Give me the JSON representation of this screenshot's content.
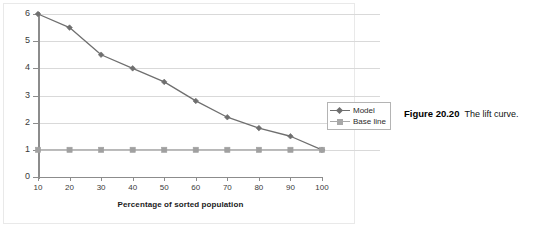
{
  "figure": {
    "caption_number": "Figure 20.20",
    "caption_text": "The lift curve."
  },
  "legend": {
    "position": "right",
    "entries": [
      {
        "label": "Model",
        "marker": "diamond-marker",
        "color": "#7d7d7d"
      },
      {
        "label": "Base line",
        "marker": "square-marker",
        "color": "#a8a8a8"
      }
    ]
  },
  "chart_data": {
    "type": "line",
    "title": "",
    "subtitle": "",
    "xlabel": "Percentage of sorted population",
    "ylabel": "",
    "x": [
      10,
      20,
      30,
      40,
      50,
      60,
      70,
      80,
      90,
      100
    ],
    "xticks": [
      "10",
      "20",
      "30",
      "40",
      "50",
      "60",
      "70",
      "80",
      "90",
      "100"
    ],
    "yticks": [
      "0",
      "1",
      "2",
      "3",
      "4",
      "5",
      "6"
    ],
    "xlim": [
      10,
      100
    ],
    "ylim": [
      0,
      6
    ],
    "grid": true,
    "grid_axis": "y",
    "legend_position": "right",
    "series": [
      {
        "name": "Model",
        "marker": "diamond",
        "color": "#6f6f6f",
        "values": [
          6.0,
          5.5,
          4.5,
          4.0,
          3.5,
          2.8,
          2.2,
          1.8,
          1.5,
          1.0
        ]
      },
      {
        "name": "Base line",
        "marker": "square",
        "color": "#a0a0a0",
        "values": [
          1.0,
          1.0,
          1.0,
          1.0,
          1.0,
          1.0,
          1.0,
          1.0,
          1.0,
          1.0
        ]
      }
    ]
  },
  "colors": {
    "model_line": "#6f6f6f",
    "baseline_line": "#a0a0a0",
    "gridline": "#d9d9d9",
    "axis": "#8c8c8c",
    "text": "#2b2b2b"
  }
}
